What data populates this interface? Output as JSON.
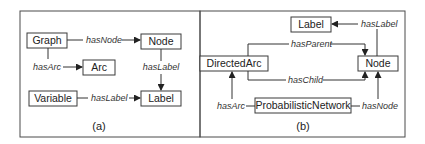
{
  "panel_a": {
    "caption": "(a)",
    "nodes": {
      "graph": "Graph",
      "node": "Node",
      "arc": "Arc",
      "variable": "Variable",
      "label": "Label"
    },
    "edges": {
      "graph_node": "hasNode",
      "graph_arc": "hasArc",
      "node_label": "hasLabel",
      "variable_label": "hasLabel"
    }
  },
  "panel_b": {
    "caption": "(b)",
    "nodes": {
      "label": "Label",
      "directed_arc": "DirectedArc",
      "node": "Node",
      "probabilistic_network": "ProbabilisticNetwork"
    },
    "edges": {
      "node_label": "hasLabel",
      "arc_parent": "hasParent",
      "arc_child": "hasChild",
      "pn_arc": "hasArc",
      "pn_node": "hasNode"
    }
  }
}
